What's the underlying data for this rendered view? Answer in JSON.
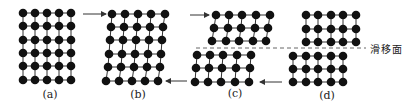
{
  "colors": {
    "atom": "#111111",
    "bond": "#333333",
    "arrow": "#333333",
    "slip": "#555555"
  },
  "atom_radius": 4.3,
  "panels": [
    {
      "id": "a",
      "label": "(a)",
      "label_pos": [
        50,
        94
      ],
      "blocks": [
        {
          "rows": [
            {
              "y": 13,
              "xs": [
                23,
                35,
                47,
                59,
                71
              ]
            },
            {
              "y": 26,
              "xs": [
                23,
                35,
                47,
                59,
                71
              ]
            },
            {
              "y": 40,
              "xs": [
                23,
                35,
                47,
                59,
                71
              ]
            },
            {
              "y": 53,
              "xs": [
                23,
                35,
                47,
                59,
                71
              ]
            },
            {
              "y": 66,
              "xs": [
                23,
                35,
                47,
                59,
                71
              ]
            },
            {
              "y": 80,
              "xs": [
                23,
                35,
                47,
                59,
                71
              ]
            }
          ]
        }
      ]
    },
    {
      "id": "b",
      "label": "(b)",
      "label_pos": [
        138,
        94
      ],
      "blocks": [
        {
          "rows": [
            {
              "y": 14,
              "xs": [
                112,
                125,
                138,
                151,
                165
              ]
            },
            {
              "y": 27,
              "xs": [
                111,
                124,
                137,
                150,
                163
              ]
            },
            {
              "y": 40,
              "xs": [
                110,
                123,
                136,
                149,
                162
              ]
            },
            {
              "y": 54,
              "xs": [
                109,
                122,
                135,
                148,
                161
              ]
            },
            {
              "y": 67,
              "xs": [
                108,
                121,
                134,
                147,
                160
              ]
            },
            {
              "y": 81,
              "xs": [
                106,
                119,
                132,
                145,
                158
              ]
            }
          ]
        }
      ]
    },
    {
      "id": "c",
      "label": "(c)",
      "label_pos": [
        235,
        93
      ],
      "blocks": [
        {
          "rows": [
            {
              "y": 15,
              "xs": [
                216,
                229,
                242,
                256,
                270
              ]
            },
            {
              "y": 28,
              "xs": [
                214,
                228,
                241,
                255,
                268
              ]
            },
            {
              "y": 41,
              "xs": [
                212,
                226,
                239,
                253,
                266
              ]
            }
          ]
        },
        {
          "rows": [
            {
              "y": 55,
              "xs": [
                197,
                210,
                223,
                237,
                251
              ]
            },
            {
              "y": 68,
              "xs": [
                196,
                209,
                222,
                236,
                250
              ]
            },
            {
              "y": 82,
              "xs": [
                195,
                208,
                221,
                235,
                249
              ]
            }
          ]
        }
      ]
    },
    {
      "id": "d",
      "label": "(d)",
      "label_pos": [
        327,
        95
      ],
      "blocks": [
        {
          "rows": [
            {
              "y": 15,
              "xs": [
                306,
                318,
                331,
                343,
                356
              ]
            },
            {
              "y": 29,
              "xs": [
                306,
                318,
                331,
                343,
                356
              ]
            },
            {
              "y": 42,
              "xs": [
                306,
                318,
                331,
                343,
                356
              ]
            }
          ]
        },
        {
          "rows": [
            {
              "y": 56,
              "xs": [
                293,
                306,
                318,
                331,
                343
              ]
            },
            {
              "y": 69,
              "xs": [
                293,
                306,
                318,
                331,
                343
              ]
            },
            {
              "y": 82,
              "xs": [
                293,
                306,
                318,
                331,
                343
              ]
            }
          ]
        }
      ]
    }
  ],
  "arrows": [
    {
      "name": "shear-arrow-top-b",
      "x1": 83,
      "y1": 14,
      "x2": 106,
      "y2": 14
    },
    {
      "name": "shear-arrow-bottom-b",
      "x1": 187,
      "y1": 81,
      "x2": 166,
      "y2": 81
    },
    {
      "name": "shear-arrow-top-c",
      "x1": 190,
      "y1": 15,
      "x2": 209,
      "y2": 15
    },
    {
      "name": "shear-arrow-bottom-c",
      "x1": 282,
      "y1": 82,
      "x2": 260,
      "y2": 82
    }
  ],
  "slip_plane": {
    "label": "滑移面",
    "line": {
      "x1": 196,
      "y1": 48,
      "x2": 366,
      "y2": 48
    },
    "label_pos": [
      370,
      48
    ]
  }
}
